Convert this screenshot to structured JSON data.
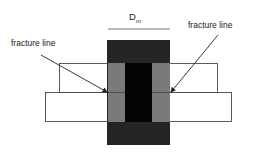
{
  "diagram": {
    "dimension_label": "D",
    "dimension_subscript": "m",
    "left_annotation": "fracture line",
    "right_annotation": "fracture line",
    "colors": {
      "dark_block": "#252525",
      "core": "#050505",
      "gray_zone": "#7a7a7a",
      "plate_fill": "#ffffff",
      "outline": "#333333"
    }
  }
}
